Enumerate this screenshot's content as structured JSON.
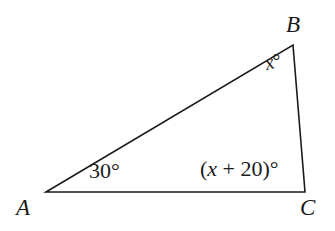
{
  "figure": {
    "type": "triangle-diagram",
    "background_color": "#ffffff",
    "stroke_color": "#1b1b1b",
    "text_color": "#1b1b1b",
    "width": 335,
    "height": 231
  },
  "vertices": [
    {
      "name": "A",
      "label": "A",
      "x": 46,
      "y": 192
    },
    {
      "name": "B",
      "label": "B",
      "x": 293,
      "y": 45
    },
    {
      "name": "C",
      "label": "C",
      "x": 305,
      "y": 192
    }
  ],
  "sides": [
    {
      "name": "AB",
      "from": "A",
      "to": "B"
    },
    {
      "name": "BC",
      "from": "B",
      "to": "C"
    },
    {
      "name": "AC",
      "from": "A",
      "to": "C"
    }
  ],
  "angles": [
    {
      "at": "A",
      "label": "30°",
      "value": "30",
      "unit": "degrees"
    },
    {
      "at": "B",
      "label_prefix": "x",
      "label_suffix": "°",
      "value": "x",
      "unit": "degrees"
    },
    {
      "at": "C",
      "label_open": "(",
      "label_var": "x",
      "label_rest": " + 20)",
      "label_suffix": "°",
      "value": "x + 20",
      "unit": "degrees"
    }
  ],
  "chart_data": {
    "type": "diagram",
    "title": "",
    "shape": "triangle",
    "points": {
      "A": [
        46,
        192
      ],
      "B": [
        293,
        45
      ],
      "C": [
        305,
        192
      ]
    },
    "angle_labels": {
      "A": "30°",
      "B": "x°",
      "C": "(x + 20)°"
    }
  }
}
